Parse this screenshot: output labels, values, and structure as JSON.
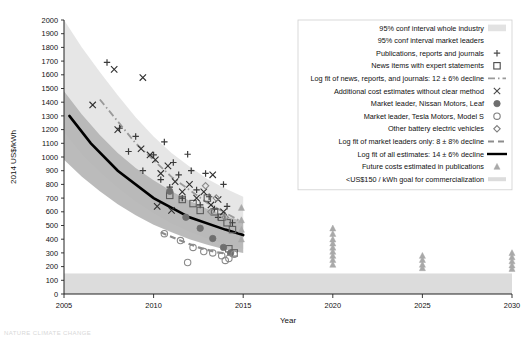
{
  "chart_data": {
    "type": "scatter",
    "title": "",
    "xlabel": "Year",
    "ylabel": "2014 US$/kWh",
    "xlim": [
      2005,
      2030
    ],
    "ylim": [
      0,
      2000
    ],
    "grid": false,
    "xticks": [
      2005,
      2010,
      2015,
      2020,
      2025,
      2030
    ],
    "xtick_labels": [
      "2005",
      "2010",
      "2015",
      "2020",
      "2025",
      "2030"
    ],
    "yticks": [
      0,
      100,
      200,
      300,
      400,
      500,
      600,
      700,
      800,
      900,
      1000,
      1100,
      1200,
      1300,
      1400,
      1500,
      1600,
      1700,
      1800,
      1900,
      2000
    ],
    "ytick_labels": [
      "0",
      "100",
      "200",
      "300",
      "400",
      "500",
      "600",
      "700",
      "800",
      "900",
      "1000",
      "1100",
      "1200",
      "1300",
      "1400",
      "1500",
      "1600",
      "1700",
      "1800",
      "1900",
      "2000"
    ],
    "legend_position": "upper right",
    "colors": {
      "band_industry": "#e2e2e2",
      "band_leaders": "#b4b4b4",
      "goal_band": "#dcdcdc",
      "fit_all": "#000000",
      "fit_news": "#9a9a9a",
      "fit_leaders": "#8d8d8d",
      "marker_dark": "#4a4a4a",
      "marker_grey": "#7d7d7d",
      "triangle": "#a9a9a9"
    },
    "series": [
      {
        "name": "95% conf interval whole industry",
        "marker": "band",
        "color": "#e2e2e2",
        "x": [
          2005,
          2006,
          2007,
          2008,
          2009,
          2010,
          2011,
          2012,
          2013,
          2014,
          2015
        ],
        "upper": [
          2000,
          1800,
          1620,
          1450,
          1290,
          1150,
          1030,
          930,
          840,
          770,
          710
        ],
        "lower": [
          1180,
          1020,
          890,
          775,
          675,
          590,
          515,
          455,
          405,
          365,
          330
        ]
      },
      {
        "name": "95% conf interval market leaders",
        "marker": "band",
        "color": "#b4b4b4",
        "x": [
          2005,
          2006,
          2007,
          2008,
          2009,
          2010,
          2011,
          2012,
          2013,
          2014,
          2015
        ],
        "upper": [
          1480,
          1310,
          1160,
          1030,
          920,
          830,
          750,
          680,
          620,
          570,
          530
        ],
        "lower": [
          980,
          855,
          750,
          655,
          575,
          505,
          450,
          400,
          360,
          325,
          300
        ]
      },
      {
        "name": "Publications, reports and journals",
        "marker": "plus",
        "color": "#3b3b3b",
        "points": [
          [
            2007.4,
            1690
          ],
          [
            2008.1,
            1210
          ],
          [
            2008.6,
            1040
          ],
          [
            2009.0,
            1150
          ],
          [
            2009.4,
            900
          ],
          [
            2010.0,
            1015
          ],
          [
            2010.4,
            835
          ],
          [
            2010.6,
            1110
          ],
          [
            2010.9,
            780
          ],
          [
            2011.1,
            960
          ],
          [
            2011.4,
            870
          ],
          [
            2011.6,
            700
          ],
          [
            2011.9,
            1020
          ],
          [
            2012.1,
            900
          ],
          [
            2012.4,
            760
          ],
          [
            2012.6,
            650
          ],
          [
            2012.9,
            880
          ],
          [
            2013.1,
            710
          ],
          [
            2013.4,
            620
          ],
          [
            2013.6,
            560
          ],
          [
            2013.9,
            800
          ],
          [
            2014.1,
            640
          ],
          [
            2014.4,
            520
          ]
        ]
      },
      {
        "name": "News items with expert statements",
        "marker": "square-open",
        "color": "#5c5c5c",
        "points": [
          [
            2010.9,
            720
          ],
          [
            2011.6,
            690
          ],
          [
            2012.2,
            660
          ],
          [
            2012.6,
            610
          ],
          [
            2013.0,
            700
          ],
          [
            2013.4,
            600
          ],
          [
            2013.8,
            560
          ],
          [
            2014.1,
            520
          ],
          [
            2014.4,
            470
          ],
          [
            2014.2,
            330
          ],
          [
            2014.5,
            300
          ]
        ]
      },
      {
        "name": "Log fit of news, reports, and journals: 12 ± 6% decline",
        "marker": "dashdot-line",
        "color": "#9a9a9a",
        "x": [
          2007,
          2009,
          2011,
          2013,
          2015
        ],
        "y": [
          1420,
          1100,
          855,
          665,
          520
        ]
      },
      {
        "name": "Additional cost estimates without clear method",
        "marker": "x",
        "color": "#2f2f2f",
        "points": [
          [
            2006.6,
            1380
          ],
          [
            2007.8,
            1640
          ],
          [
            2009.4,
            1580
          ],
          [
            2008.0,
            1200
          ],
          [
            2009.3,
            1060
          ],
          [
            2009.8,
            1015
          ],
          [
            2010.1,
            980
          ],
          [
            2010.4,
            880
          ],
          [
            2010.8,
            935
          ],
          [
            2011.2,
            820
          ],
          [
            2011.6,
            745
          ],
          [
            2012.0,
            800
          ],
          [
            2012.4,
            700
          ],
          [
            2012.8,
            745
          ],
          [
            2013.2,
            650
          ],
          [
            2013.6,
            690
          ],
          [
            2013.9,
            600
          ],
          [
            2010.2,
            640
          ],
          [
            2011.0,
            610
          ],
          [
            2013.3,
            870
          ]
        ]
      },
      {
        "name": "Market leader, Nissan Motors, Leaf",
        "marker": "circle-filled",
        "color": "#6e6e6e",
        "points": [
          [
            2010.9,
            750
          ],
          [
            2011.8,
            560
          ],
          [
            2012.6,
            480
          ],
          [
            2013.3,
            405
          ],
          [
            2013.9,
            340
          ],
          [
            2014.3,
            300
          ]
        ]
      },
      {
        "name": "Market leader, Tesla Motors, Model S",
        "marker": "circle-open",
        "color": "#8a8a8a",
        "points": [
          [
            2010.6,
            440
          ],
          [
            2011.5,
            390
          ],
          [
            2012.2,
            340
          ],
          [
            2012.8,
            310
          ],
          [
            2013.3,
            300
          ],
          [
            2013.8,
            280
          ],
          [
            2014.2,
            260
          ],
          [
            2011.9,
            230
          ],
          [
            2014.0,
            245
          ],
          [
            2014.5,
            290
          ]
        ]
      },
      {
        "name": "Other battery electric vehicles",
        "marker": "diamond-open",
        "color": "#8a8a8a",
        "points": [
          [
            2012.9,
            790
          ],
          [
            2013.5,
            700
          ],
          [
            2014.0,
            560
          ],
          [
            2013.2,
            600
          ]
        ]
      },
      {
        "name": "Log fit of market leaders only: 8 ± 8% decline",
        "marker": "dashed-line",
        "color": "#8d8d8d",
        "x": [
          2010.4,
          2011.5,
          2012.5,
          2013.5,
          2014.6
        ],
        "y": [
          450,
          390,
          340,
          305,
          285
        ]
      },
      {
        "name": "Log fit of all estimates: 14 ± 6% decline",
        "marker": "solid-line",
        "color": "#000000",
        "x": [
          2005.3,
          2006.5,
          2008,
          2010,
          2012,
          2014,
          2015
        ],
        "y": [
          1300,
          1100,
          900,
          700,
          560,
          470,
          430
        ]
      },
      {
        "name": "Future costs estimated in publications",
        "marker": "triangle",
        "color": "#a9a9a9",
        "points": [
          [
            2014.9,
            630
          ],
          [
            2014.9,
            540
          ],
          [
            2014.9,
            470
          ],
          [
            2014.9,
            400
          ],
          [
            2020,
            480
          ],
          [
            2020,
            440
          ],
          [
            2020,
            400
          ],
          [
            2020,
            370
          ],
          [
            2020,
            340
          ],
          [
            2020,
            310
          ],
          [
            2020,
            280
          ],
          [
            2020,
            250
          ],
          [
            2020,
            215
          ],
          [
            2025,
            280
          ],
          [
            2025,
            250
          ],
          [
            2025,
            215
          ],
          [
            2025,
            190
          ],
          [
            2030,
            300
          ],
          [
            2030,
            270
          ],
          [
            2030,
            240
          ],
          [
            2030,
            210
          ],
          [
            2030,
            185
          ]
        ]
      },
      {
        "name": "<US$150 / kWh goal for commercialization",
        "marker": "hband",
        "color": "#dcdcdc",
        "y_top": 150,
        "y_bottom": 0
      }
    ]
  },
  "legend": {
    "items": [
      {
        "label": "95% conf interval whole industry",
        "marker": "band-light"
      },
      {
        "label": "95% conf interval market leaders",
        "marker": "band-dark"
      },
      {
        "label": "Publications, reports and journals",
        "marker": "plus"
      },
      {
        "label": "News items with expert statements",
        "marker": "square-open"
      },
      {
        "label": "Log fit of news, reports, and journals: 12 ± 6% decline",
        "marker": "dashdot-line"
      },
      {
        "label": "Additional cost estimates without clear method",
        "marker": "x"
      },
      {
        "label": "Market leader, Nissan Motors, Leaf",
        "marker": "circle-filled"
      },
      {
        "label": "Market leader, Tesla Motors, Model S",
        "marker": "circle-open"
      },
      {
        "label": "Other battery electric vehicles",
        "marker": "diamond-open"
      },
      {
        "label": "Log fit of market leaders only: 8 ± 8% decline",
        "marker": "dashed-line"
      },
      {
        "label": "Log fit of all estimates: 14 ± 6% decline",
        "marker": "solid-line"
      },
      {
        "label": "Future costs estimated in publications",
        "marker": "triangle"
      },
      {
        "label": "<US$150 / kWh goal for commercialization",
        "marker": "hband"
      }
    ]
  },
  "caption": "NATURE CLIMATE CHANGE"
}
